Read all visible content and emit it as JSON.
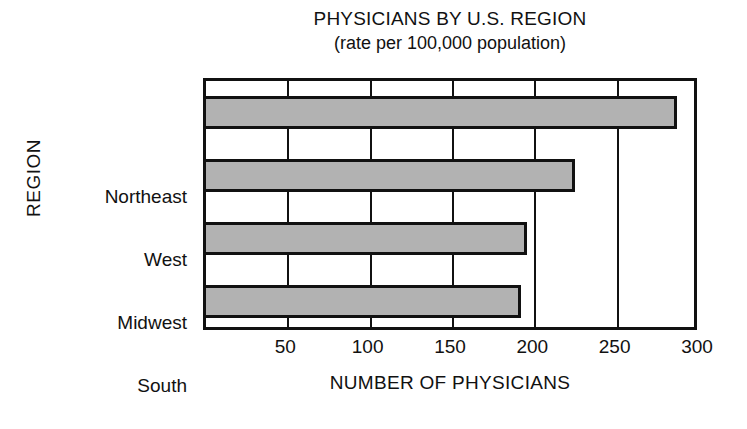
{
  "chart_data": {
    "type": "bar",
    "orientation": "horizontal",
    "title": "PHYSICIANS BY U.S. REGION",
    "subtitle": "(rate per 100,000 population)",
    "xlabel": "NUMBER OF PHYSICIANS",
    "ylabel": "REGION",
    "categories": [
      "Northeast",
      "West",
      "Midwest",
      "South"
    ],
    "values": [
      286,
      224,
      195,
      191
    ],
    "xlim": [
      0,
      300
    ],
    "xticks": [
      50,
      100,
      150,
      200,
      250,
      300
    ],
    "xtick_labels": [
      "50",
      "100",
      "150",
      "200",
      "250",
      "300"
    ],
    "grid": true,
    "grid_axis": "x",
    "legend": false,
    "bar_fill_color": "#b2b2b2",
    "bar_edge_color": "#111111",
    "axis_color": "#111111",
    "background_color": "#ffffff"
  }
}
